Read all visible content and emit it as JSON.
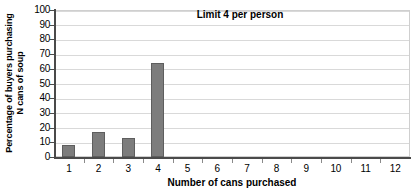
{
  "chart_data": {
    "type": "bar",
    "title": "Limit 4 per person",
    "xlabel": "Number of cans purchased",
    "ylabel_line1": "Percentage of buyers purchasing",
    "ylabel_line2": "N cans of soup",
    "ylabel": "Percentage of buyers purchasing N cans of soup",
    "categories": [
      "1",
      "2",
      "3",
      "4",
      "5",
      "6",
      "7",
      "8",
      "9",
      "10",
      "11",
      "12"
    ],
    "values": [
      8,
      17,
      13,
      64,
      0,
      0,
      0,
      0,
      0,
      0,
      0,
      0
    ],
    "ylim": [
      0,
      100
    ],
    "ytick_step": 10,
    "yticks": [
      "100",
      "90",
      "80",
      "70",
      "60",
      "50",
      "40",
      "30",
      "20",
      "10",
      "0"
    ],
    "grid": true,
    "grid_axis": "y",
    "legend": false,
    "bar_color": "#7d7d7d",
    "bar_edge_color": "#5e5e5e",
    "gridline_color": "#d9d9d9",
    "axis_color": "#4a4a4a",
    "plot_border_color": "#cfcfcf",
    "background_color": "#ffffff"
  }
}
